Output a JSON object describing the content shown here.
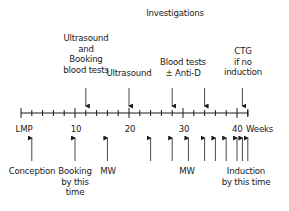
{
  "title": "Investigations",
  "axis": {
    "start_week": 0,
    "end_week": 42,
    "unit_label": "Weeks",
    "tick_labels": [
      {
        "week": 0,
        "label": "LMP"
      },
      {
        "week": 10,
        "label": "10"
      },
      {
        "week": 20,
        "label": "20"
      },
      {
        "week": 30,
        "label": "30"
      },
      {
        "week": 40,
        "label": "40"
      }
    ]
  },
  "investigations": [
    {
      "week": 12,
      "label_lines": [
        "Ultrasound",
        "and",
        "Booking",
        "blood tests"
      ]
    },
    {
      "week": 20,
      "label_lines": [
        "Ultrasound"
      ]
    },
    {
      "week": 28,
      "label_lines": [
        "Blood tests",
        "± Anti-D"
      ]
    },
    {
      "week": 34,
      "label_lines": []
    },
    {
      "week": 41,
      "label_lines": [
        "CTG",
        "if no",
        "induction"
      ]
    }
  ],
  "visits": {
    "arrow_weeks": [
      2,
      10,
      16,
      24,
      28,
      31,
      34,
      36,
      38,
      40,
      41,
      42
    ],
    "labels": [
      {
        "id": "conception",
        "lines": [
          "Conception"
        ]
      },
      {
        "id": "booking",
        "lines": [
          "Booking",
          "by this",
          "time"
        ]
      },
      {
        "id": "mw-1",
        "lines": [
          "MW"
        ]
      },
      {
        "id": "mw-2",
        "lines": [
          "MW"
        ]
      },
      {
        "id": "induction",
        "lines": [
          "Induction",
          "by this time"
        ]
      }
    ]
  }
}
